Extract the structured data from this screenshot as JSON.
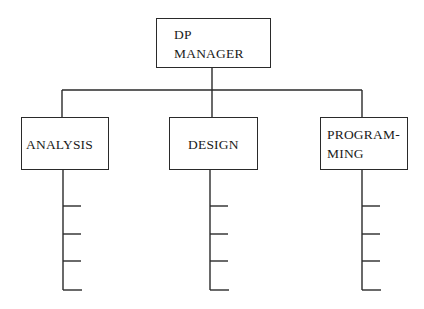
{
  "diagram": {
    "type": "org-chart",
    "root": {
      "label_line1": "DP",
      "label_line2": "MANAGER"
    },
    "children": [
      {
        "id": "analysis",
        "label_line1": "ANALYSIS",
        "label_line2": "",
        "sub_items": 4
      },
      {
        "id": "design",
        "label_line1": "DESIGN",
        "label_line2": "",
        "sub_items": 4
      },
      {
        "id": "programming",
        "label_line1": "PROGRAM-",
        "label_line2": "MING",
        "sub_items": 4
      }
    ],
    "line_color": "#2a2a2a",
    "background": "#ffffff"
  }
}
